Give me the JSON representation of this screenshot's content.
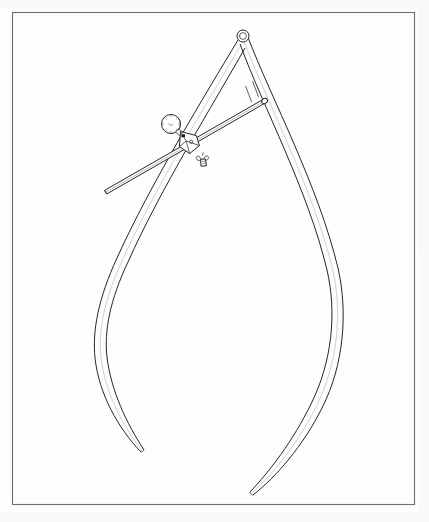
{
  "document": {
    "title": "Technical line drawing — outside caliper with adjusting rod",
    "medium": "pen and ink line drawing",
    "background_color": "#fdfdfc",
    "ink_color": "#262626",
    "frame_color": "#6e6e6e",
    "width": 429,
    "height": 522
  },
  "frame": {
    "name": "plate-border",
    "x": 12,
    "y": 12,
    "width": 403,
    "height": 493,
    "stroke_width": 1.1
  },
  "figure": {
    "subject": "outside caliper",
    "caption": "",
    "parts": [
      {
        "id": "pivot-ring",
        "label": "pivot ring",
        "center_x": 243,
        "center_y": 36,
        "outer_radius": 6,
        "inner_radius": 3.4
      },
      {
        "id": "left-leg",
        "label": "left curved leg",
        "tip_x": 140,
        "tip_y": 452,
        "max_bulge_x": 95,
        "max_bulge_y": 312
      },
      {
        "id": "right-leg",
        "label": "right curved leg",
        "tip_x": 252,
        "tip_y": 496,
        "max_bulge_x": 341,
        "max_bulge_y": 300
      },
      {
        "id": "adjusting-rod",
        "label": "adjusting rod",
        "start_x": 104,
        "start_y": 190,
        "end_x": 266,
        "end_y": 102
      },
      {
        "id": "knurled-knob",
        "label": "knurled adjusting knob",
        "center_x": 171,
        "center_y": 124,
        "radius": 9.5
      },
      {
        "id": "clamp-block",
        "label": "clamp block",
        "center_x": 188,
        "center_y": 140
      },
      {
        "id": "wing-nut",
        "label": "wing nut",
        "center_x": 203,
        "center_y": 161
      }
    ]
  }
}
